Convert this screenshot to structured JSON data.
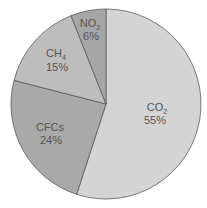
{
  "chart_data": {
    "type": "pie",
    "title": "",
    "categories": [
      "CO2",
      "CFCs",
      "CH4",
      "NO2"
    ],
    "values": [
      55,
      24,
      15,
      6
    ],
    "labels": [
      {
        "name": "CO",
        "sub": "2",
        "pct": "55%"
      },
      {
        "name": "CFCs",
        "sub": "",
        "pct": "24%"
      },
      {
        "name": "CH",
        "sub": "4",
        "pct": "15%"
      },
      {
        "name": "NO",
        "sub": "2",
        "pct": "6%"
      }
    ],
    "colors": [
      "#d4d4d4",
      "#a9a9a9",
      "#bdbdbd",
      "#a6a6a6"
    ],
    "start_angle": "12 o'clock",
    "direction": "clockwise",
    "legend": "none"
  }
}
